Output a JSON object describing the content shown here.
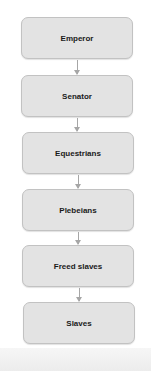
{
  "diagram": {
    "type": "hierarchy-flowchart",
    "nodes": [
      {
        "label": "Emperor"
      },
      {
        "label": "Senator"
      },
      {
        "label": "Equestrians"
      },
      {
        "label": "Plebeians"
      },
      {
        "label": "Freed slaves"
      },
      {
        "label": "Slaves"
      }
    ],
    "edges": [
      {
        "from": "Emperor",
        "to": "Senator"
      },
      {
        "from": "Senator",
        "to": "Equestrians"
      },
      {
        "from": "Equestrians",
        "to": "Plebeians"
      },
      {
        "from": "Plebeians",
        "to": "Freed slaves"
      },
      {
        "from": "Freed slaves",
        "to": "Slaves"
      }
    ],
    "colors": {
      "box_fill": "#e3e3e3",
      "box_border": "#c2c2c2",
      "arrow": "#a6a6a6",
      "text": "#1a1a1a"
    }
  }
}
